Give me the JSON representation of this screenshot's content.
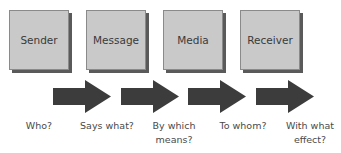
{
  "boxes": [
    {
      "label": "Sender",
      "x": 9
    },
    {
      "label": "Message",
      "x": 86
    },
    {
      "label": "Media",
      "x": 163
    },
    {
      "label": "Receiver",
      "x": 240
    }
  ],
  "questions": [
    {
      "line1": "Who?",
      "line2": ""
    },
    {
      "line1": "Says what?",
      "line2": ""
    },
    {
      "line1": "By which",
      "line2": "means?"
    },
    {
      "line1": "To whom?",
      "line2": ""
    },
    {
      "line1": "With what",
      "line2": "effect?"
    }
  ],
  "colors": {
    "box_fill": "#c9c9c9",
    "box_shadow": "#5a5a5a",
    "arrow": "#3c3c3c",
    "text": "#3a3a3a"
  }
}
